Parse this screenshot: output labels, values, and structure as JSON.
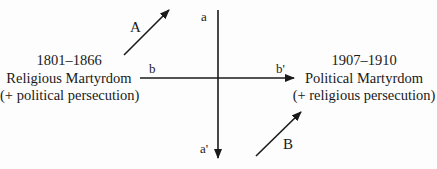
{
  "diagram": {
    "left_period": {
      "years": "1801–1866",
      "title": "Religious Martyrdom",
      "note": "(+ political persecution)"
    },
    "right_period": {
      "years": "1907–1910",
      "title": "Political Martyrdom",
      "note": "(+ religious persecution)"
    },
    "axes": {
      "vertical_top": "a",
      "vertical_bottom": "a'",
      "horizontal_left": "b",
      "horizontal_right": "b'"
    },
    "arrows": {
      "upper_left": "A",
      "lower_right": "B"
    },
    "colors": {
      "ink": "#1a1a1a",
      "background": "#fdfdfd"
    }
  }
}
